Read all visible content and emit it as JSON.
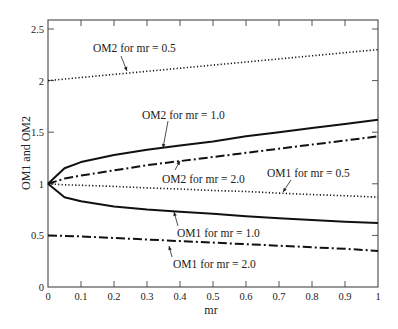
{
  "chart_data": {
    "type": "line",
    "title": "",
    "xlabel": "mr",
    "ylabel": "OM1 and OM2",
    "xlim": [
      0,
      1
    ],
    "ylim": [
      0,
      2.59
    ],
    "grid": false,
    "legend": "none (inline annotations with arrows)",
    "x_ticks": [
      "0",
      "0.1",
      "0.2",
      "0.3",
      "0.4",
      "0.5",
      "0.6",
      "0.7",
      "0.8",
      "0.9",
      "1"
    ],
    "y_ticks": [
      "0",
      "0.5",
      "1",
      "1.5",
      "2",
      "2.5"
    ],
    "x": [
      0,
      0.05,
      0.1,
      0.2,
      0.3,
      0.4,
      0.5,
      0.6,
      0.7,
      0.8,
      0.9,
      1.0
    ],
    "series": [
      {
        "name": "OM2 for mr = 0.5",
        "style": "dotted",
        "values": [
          2.0,
          2.015,
          2.03,
          2.06,
          2.09,
          2.12,
          2.15,
          2.18,
          2.21,
          2.24,
          2.27,
          2.3
        ]
      },
      {
        "name": "OM2 for mr = 1.0",
        "style": "solid",
        "values": [
          1.0,
          1.15,
          1.21,
          1.28,
          1.33,
          1.37,
          1.41,
          1.46,
          1.5,
          1.54,
          1.58,
          1.62
        ]
      },
      {
        "name": "OM2 for mr = 2.0",
        "style": "dash-dot",
        "values": [
          1.0,
          1.05,
          1.08,
          1.13,
          1.18,
          1.22,
          1.26,
          1.3,
          1.34,
          1.38,
          1.42,
          1.46
        ]
      },
      {
        "name": "OM1 for mr = 0.5",
        "style": "dotted",
        "values": [
          1.0,
          0.99,
          0.985,
          0.975,
          0.96,
          0.95,
          0.935,
          0.925,
          0.91,
          0.895,
          0.885,
          0.87
        ]
      },
      {
        "name": "OM1 for mr = 1.0",
        "style": "solid",
        "values": [
          1.0,
          0.87,
          0.83,
          0.78,
          0.75,
          0.73,
          0.71,
          0.685,
          0.667,
          0.649,
          0.633,
          0.62
        ]
      },
      {
        "name": "OM1 for mr = 2.0",
        "style": "dash-dot",
        "values": [
          0.5,
          0.495,
          0.49,
          0.475,
          0.46,
          0.445,
          0.43,
          0.415,
          0.4,
          0.385,
          0.37,
          0.35
        ]
      }
    ],
    "annotations": [
      {
        "text": "OM2 for mr = 0.5",
        "tx": 93,
        "ty": 48,
        "ax1": 121,
        "ay1": 56,
        "ax2": 127,
        "ay2": 71
      },
      {
        "text": "OM2 for mr = 1.0",
        "tx": 142,
        "ty": 115,
        "ax1": 168,
        "ay1": 121,
        "ax2": 163,
        "ay2": 148
      },
      {
        "text": "OM2 for mr = 2.0",
        "tx": 162,
        "ty": 179,
        "ax1": 175,
        "ay1": 170,
        "ax2": 180,
        "ay2": 161
      },
      {
        "text": "OM1 for mr = 0.5",
        "tx": 267,
        "ty": 173,
        "ax1": 291,
        "ay1": 180,
        "ax2": 283,
        "ay2": 192
      },
      {
        "text": "OM1 for mr = 1.0",
        "tx": 177,
        "ty": 233,
        "ax1": 178,
        "ay1": 226,
        "ax2": 174,
        "ay2": 212
      },
      {
        "text": "OM1 for mr = 2.0",
        "tx": 173,
        "ty": 264,
        "ax1": 172,
        "ay1": 257,
        "ax2": 169,
        "ay2": 246
      }
    ]
  }
}
